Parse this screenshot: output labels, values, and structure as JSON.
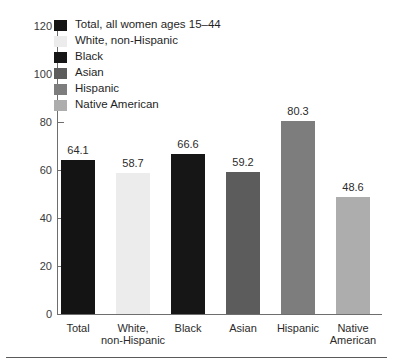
{
  "chart_data": {
    "type": "bar",
    "title": "",
    "subtitle": "",
    "xlabel": "",
    "ylabel": "",
    "ylim": [
      0,
      120
    ],
    "yticks": [
      0,
      20,
      40,
      60,
      80,
      100,
      120
    ],
    "grid": false,
    "legend_position": "top-left",
    "categories": [
      "Total",
      "White, non-Hispanic",
      "Black",
      "Asian",
      "Hispanic",
      "Native American"
    ],
    "category_lines": [
      [
        "Total"
      ],
      [
        "White,",
        "non-Hispanic"
      ],
      [
        "Black"
      ],
      [
        "Asian"
      ],
      [
        "Hispanic"
      ],
      [
        "Native",
        "American"
      ]
    ],
    "values": [
      64.1,
      58.7,
      66.6,
      59.2,
      80.3,
      48.6
    ],
    "value_labels": [
      "64.1",
      "58.7",
      "66.6",
      "59.2",
      "80.3",
      "48.6"
    ],
    "colors": [
      "#141414",
      "#ececec",
      "#161616",
      "#5c5c5c",
      "#7d7d7d",
      "#adadad"
    ],
    "legend": [
      {
        "label": "Total, all women ages 15–44",
        "color": "#141414"
      },
      {
        "label": "White, non-Hispanic",
        "color": "#ececec"
      },
      {
        "label": "Black",
        "color": "#161616"
      },
      {
        "label": "Asian",
        "color": "#5c5c5c"
      },
      {
        "label": "Hispanic",
        "color": "#7d7d7d"
      },
      {
        "label": "Native American",
        "color": "#adadad"
      }
    ]
  }
}
